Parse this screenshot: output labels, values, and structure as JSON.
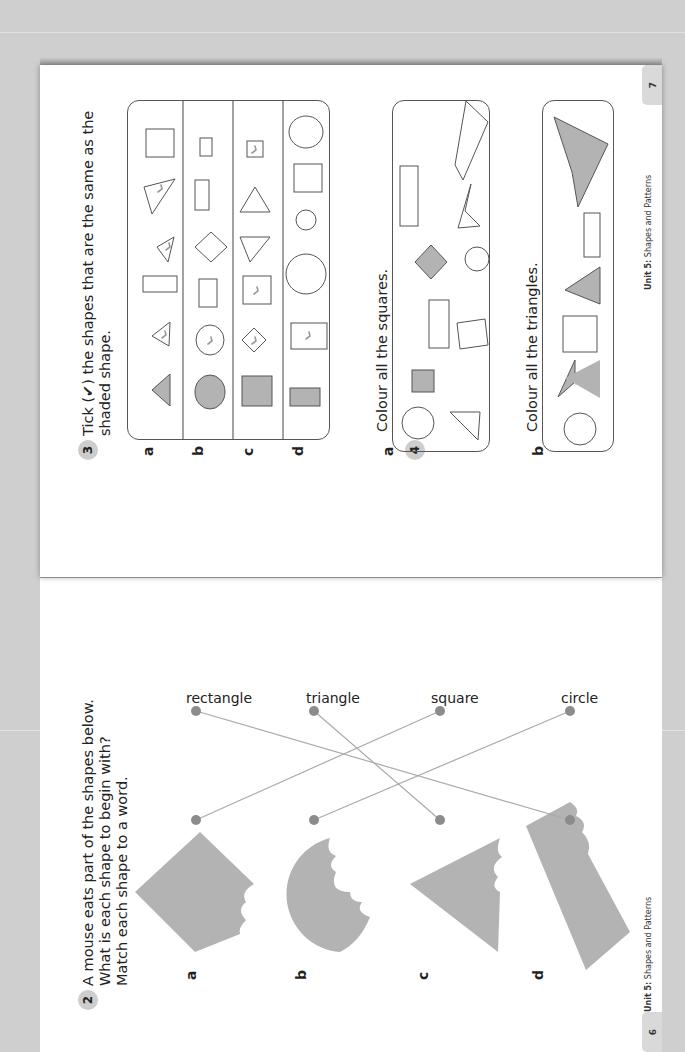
{
  "pages": {
    "left": {
      "number": "6",
      "footer_unit": "Unit 5:",
      "footer_title": "Shapes and Patterns"
    },
    "right": {
      "number": "7",
      "footer_unit": "Unit 5:",
      "footer_title": "Shapes and Patterns"
    }
  },
  "exercise2": {
    "number": "2",
    "lines": [
      "A mouse eats part of the shapes below.",
      "What is each shape to begin with?",
      "Match each shape to a word."
    ],
    "items": [
      {
        "label": "a",
        "shape": "square (diamond), bitten"
      },
      {
        "label": "b",
        "shape": "circle, bitten"
      },
      {
        "label": "c",
        "shape": "triangle, bitten"
      },
      {
        "label": "d",
        "shape": "rectangle, bitten"
      }
    ],
    "words": [
      "rectangle",
      "triangle",
      "square",
      "circle"
    ],
    "matches": [
      {
        "from": "a",
        "to": "square"
      },
      {
        "from": "b",
        "to": "circle"
      },
      {
        "from": "c",
        "to": "triangle"
      },
      {
        "from": "d",
        "to": "rectangle"
      }
    ]
  },
  "exercise3": {
    "number": "3",
    "lines": [
      "Tick (✔) the shapes that are the same as the",
      "shaded shape."
    ],
    "rows": [
      {
        "label": "a",
        "shaded": "triangle",
        "options": [
          "triangle (ticked)",
          "rectangle",
          "triangle (ticked)",
          "triangle (ticked)",
          "square"
        ]
      },
      {
        "label": "b",
        "shaded": "circle",
        "options": [
          "circle (ticked)",
          "rectangle",
          "square (diamond)",
          "rectangle",
          "rectangle"
        ]
      },
      {
        "label": "c",
        "shaded": "square",
        "options": [
          "square (diamond, ticked)",
          "square (ticked)",
          "triangle",
          "triangle",
          "square (ticked)"
        ]
      },
      {
        "label": "d",
        "shaded": "rectangle",
        "options": [
          "rectangle (ticked)",
          "circle",
          "circle",
          "square",
          "circle"
        ]
      }
    ]
  },
  "exercise4": {
    "number": "4",
    "parts": [
      {
        "label": "a",
        "text": "Colour all the squares."
      },
      {
        "label": "b",
        "text": "Colour all the triangles."
      }
    ]
  }
}
